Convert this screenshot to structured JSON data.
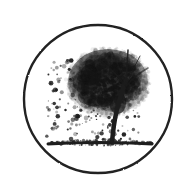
{
  "image": {
    "title": "Tree in circular medallion",
    "style": "monochrome stippled engraving",
    "background_color": "#ffffff",
    "ink_color": "#1a1a1a",
    "width": 194,
    "height": 195
  },
  "medallion": {
    "shape_name": "circle-border",
    "center_x": 98,
    "center_y": 99,
    "radius": 74,
    "stroke_width": 2.4,
    "stroke_color": "#232323"
  },
  "tree": {
    "label": "stippled tree",
    "canopy": {
      "center_x": 108,
      "center_y": 82,
      "radius_x": 40,
      "radius_y": 33,
      "top_y": 48,
      "left_x": 68,
      "right_x": 147,
      "density": "dense",
      "core_color": "#141414"
    },
    "trunk": {
      "base_x": 112,
      "base_y": 142,
      "top_x": 126,
      "top_y": 80,
      "lean": "right",
      "width": 4.5,
      "color": "#1c1c1c"
    },
    "scatter": {
      "label": "falling leaf stipple",
      "region_x": [
        46,
        140
      ],
      "region_y": [
        60,
        140
      ],
      "dot_count": 260
    }
  },
  "ground": {
    "label": "ground shadow line",
    "start_x": 48,
    "end_x": 152,
    "y": 143,
    "thickness": 3,
    "color": "#1f1f1f"
  },
  "seed": 20240817
}
